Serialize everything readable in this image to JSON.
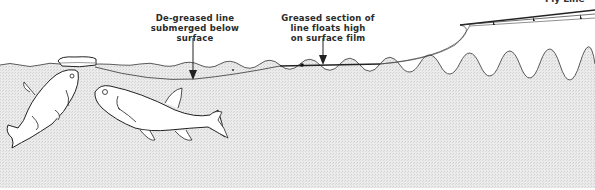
{
  "diagram": {
    "title_clipped": "Fly Line",
    "labels": {
      "degreased": {
        "lines": [
          "De-greased line",
          "submerged below",
          "surface"
        ]
      },
      "greased": {
        "lines": [
          "Greased section of",
          "line floats high",
          "on surface film"
        ]
      }
    },
    "elements": [
      "water-surface",
      "floating-crust-bait",
      "fish-rising",
      "fish-swimming",
      "fishing-line",
      "fishing-rod"
    ],
    "colors": {
      "water": "#e6e6e6",
      "ink": "#2a2a2a",
      "background": "#ffffff"
    }
  }
}
